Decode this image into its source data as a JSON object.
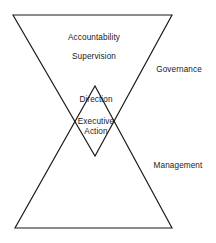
{
  "diagram": {
    "type": "bowtie-hourglass-triangles",
    "stroke_color": "#1a1a1a",
    "background_color": "#ffffff",
    "shapes": [
      {
        "name": "downward-triangle-governance",
        "points": "13,15 172,15 95,156"
      },
      {
        "name": "upward-triangle-management",
        "points": "15,228 172,228 95,86"
      }
    ],
    "inner_labels": [
      {
        "name": "accountability",
        "text": "Accountability",
        "x": 94,
        "y": 38
      },
      {
        "name": "supervision",
        "text": "Supervision",
        "x": 94,
        "y": 57
      },
      {
        "name": "direction",
        "text": "Direction",
        "x": 96,
        "y": 100
      },
      {
        "name": "executive-action-line1",
        "text": "Executive",
        "x": 96,
        "y": 122
      },
      {
        "name": "executive-action-line2",
        "text": "Action",
        "x": 96,
        "y": 132
      }
    ],
    "outer_labels": [
      {
        "name": "governance",
        "text": "Governance",
        "x": 179,
        "y": 70
      },
      {
        "name": "management",
        "text": "Management",
        "x": 178,
        "y": 166
      }
    ]
  }
}
